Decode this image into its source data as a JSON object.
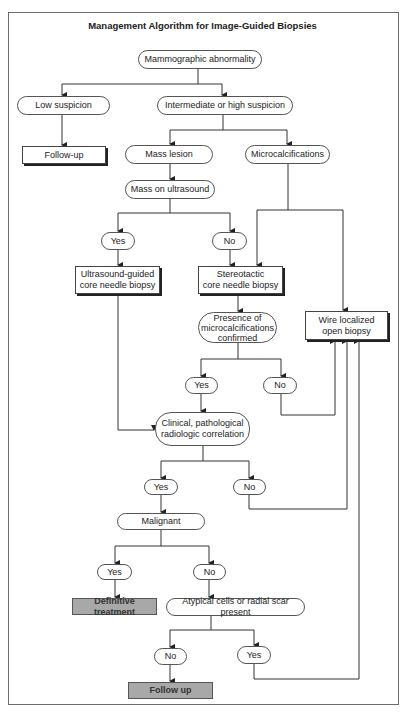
{
  "title": "Management Algorithm for Image-Guided Biopsies",
  "nodes": {
    "mammographic_abnormality": "Mammographic abnormality",
    "low_suspicion": "Low suspicion",
    "intermediate_high_suspicion": "Intermediate or high suspicion",
    "follow_up_1": "Follow-up",
    "mass_lesion": "Mass lesion",
    "microcalcifications": "Microcalcifications",
    "mass_on_ultrasound": "Mass on ultrasound",
    "us_yes": "Yes",
    "us_no": "No",
    "us_guided_biopsy_l1": "Ultrasound-guided",
    "us_guided_biopsy_l2": "core needle biopsy",
    "stereotactic_l1": "Stereotactic",
    "stereotactic_l2": "core needle biopsy",
    "presence_l1": "Presence of",
    "presence_l2": "microcalcifications",
    "presence_l3": "confirmed",
    "wire_l1": "Wire localized",
    "wire_l2": "open biopsy",
    "presence_yes": "Yes",
    "presence_no": "No",
    "correlation_l1": "Clinical, pathological",
    "correlation_l2": "radiologic correlation",
    "correlation_yes": "Yes",
    "correlation_no": "No",
    "malignant": "Malignant",
    "malignant_yes": "Yes",
    "malignant_no": "No",
    "definitive_treatment": "Definitive treatment",
    "atypical": "Atypical cells or radial scar present",
    "atypical_no": "No",
    "atypical_yes": "Yes",
    "follow_up_2": "Follow up"
  },
  "colors": {
    "frame": "#6b6b6b",
    "line": "#333333",
    "terminal_fill": "#a8a8a8"
  }
}
